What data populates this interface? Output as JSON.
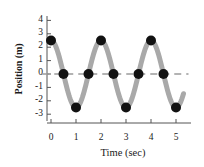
{
  "chart_data": {
    "type": "line",
    "title": "",
    "xlabel": "Time (sec)",
    "ylabel": "Position (m)",
    "xlim": [
      -0.35,
      5.55
    ],
    "ylim": [
      -3.4,
      4.4
    ],
    "xticks": [
      0,
      1,
      2,
      3,
      4,
      5
    ],
    "xtick_labels": [
      "0",
      "1",
      "2",
      "3",
      "4",
      "5"
    ],
    "yticks": [
      4,
      3,
      2,
      1,
      0,
      -1,
      -2,
      -3
    ],
    "ytick_labels": [
      "4",
      "3",
      "2",
      "1",
      "0",
      "-1",
      "-2",
      "-3"
    ],
    "grid": false,
    "legend": null,
    "zero_line": {
      "y": 0,
      "style": "dashed",
      "color": "#9a9a9a",
      "x_start": -0.35,
      "x_end": 5.5
    },
    "series": [
      {
        "name": "position",
        "kind": "curve",
        "function": "y = 2.5 * cos(pi * t)",
        "amplitude": 2.5,
        "period": 2.0,
        "phase": 0,
        "color": "#a9a9a9",
        "linewidth": 5,
        "x_start": 0.0,
        "x_end": 5.3
      },
      {
        "name": "sampled-points",
        "kind": "scatter",
        "color": "#111111",
        "marker": "circle",
        "marker_size": 5,
        "x": [
          0.0,
          0.5,
          1.0,
          1.5,
          2.0,
          2.5,
          3.0,
          3.5,
          4.0,
          4.5,
          5.0
        ],
        "y": [
          2.5,
          0.0,
          -2.5,
          0.0,
          2.5,
          0.0,
          -2.5,
          0.0,
          2.5,
          0.0,
          -2.5
        ]
      }
    ]
  },
  "axes": {
    "y_axis_color": "#555555",
    "x_axis_color": "#555555"
  }
}
